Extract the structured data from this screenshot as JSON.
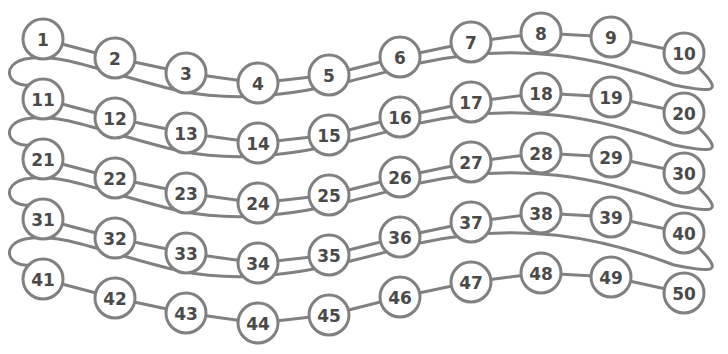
{
  "diagram": {
    "type": "number-path",
    "stroke_color": "#808080",
    "text_color": "#4a4a4a",
    "background": "#ffffff",
    "rows": 5,
    "per_row": 10,
    "row_spacing": 60,
    "radius": 20,
    "base_row_points": [
      [
        43,
        39
      ],
      [
        115,
        58
      ],
      [
        186,
        73
      ],
      [
        258,
        83
      ],
      [
        329,
        75
      ],
      [
        400,
        57
      ],
      [
        471,
        42
      ],
      [
        541,
        33
      ],
      [
        611,
        37
      ],
      [
        684,
        53
      ]
    ],
    "labels": [
      "1",
      "2",
      "3",
      "4",
      "5",
      "6",
      "7",
      "8",
      "9",
      "10",
      "11",
      "12",
      "13",
      "14",
      "15",
      "16",
      "17",
      "18",
      "19",
      "20",
      "21",
      "22",
      "23",
      "24",
      "25",
      "26",
      "27",
      "28",
      "29",
      "30",
      "31",
      "32",
      "33",
      "34",
      "35",
      "36",
      "37",
      "38",
      "39",
      "40",
      "41",
      "42",
      "43",
      "44",
      "45",
      "46",
      "47",
      "48",
      "49",
      "50"
    ]
  }
}
